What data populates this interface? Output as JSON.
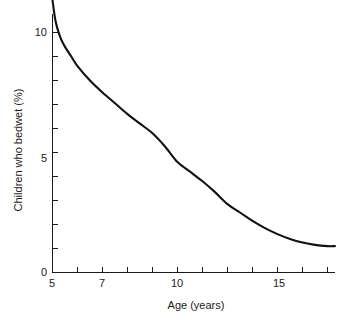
{
  "chart_data": {
    "type": "line",
    "title": "",
    "subtitle": "",
    "xlabel": "Age (years)",
    "ylabel": "Children who bedwet (%)",
    "xlim": [
      5,
      16.3
    ],
    "ylim": [
      0,
      11.5
    ],
    "grid": false,
    "legend": null,
    "legend_position": "none",
    "x_ticks_major": [
      5,
      7,
      10,
      15
    ],
    "x_tick_labels": [
      "5",
      "7",
      "10",
      "15"
    ],
    "x_ticks_all": [
      5,
      6,
      7,
      8,
      9,
      10,
      11,
      12,
      13,
      14,
      15,
      16
    ],
    "y_ticks_major": [
      0,
      5,
      10
    ],
    "y_tick_labels": [
      "0",
      "5",
      "10"
    ],
    "y_ticks_all": [
      0,
      1,
      2,
      3,
      4,
      5,
      6,
      7,
      8,
      9,
      10
    ],
    "series": [
      {
        "name": "Children who bedwet",
        "color": "#111111",
        "x": [
          5.0,
          5.1,
          5.2,
          5.35,
          5.5,
          5.75,
          6.0,
          6.5,
          7.0,
          7.5,
          8.0,
          8.5,
          9.0,
          9.5,
          10.0,
          10.5,
          11.0,
          11.5,
          12.0,
          12.5,
          13.0,
          13.5,
          14.0,
          14.5,
          15.0,
          15.5,
          16.0,
          16.3
        ],
        "y": [
          11.35,
          10.6,
          10.15,
          9.7,
          9.4,
          9.0,
          8.6,
          8.0,
          7.5,
          7.05,
          6.6,
          6.2,
          5.8,
          5.25,
          4.6,
          4.2,
          3.8,
          3.35,
          2.85,
          2.5,
          2.15,
          1.85,
          1.6,
          1.4,
          1.25,
          1.15,
          1.1,
          1.1
        ]
      }
    ],
    "annotations": []
  },
  "axes": {
    "x_axis_name": "age-axis",
    "y_axis_name": "percentage-axis"
  }
}
